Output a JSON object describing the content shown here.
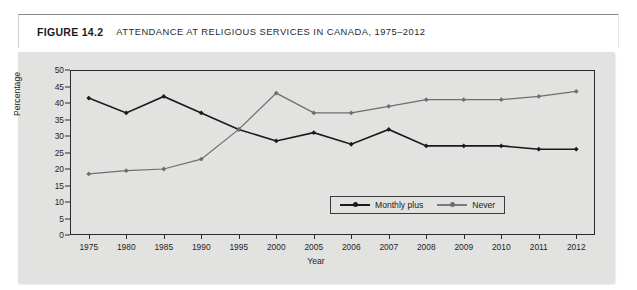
{
  "figure": {
    "number": "FIGURE 14.2",
    "title": "ATTENDANCE AT RELIGIOUS SERVICES IN CANADA, 1975–2012"
  },
  "colors": {
    "panel_background": "#e2e2e0",
    "frame": "#2a2a2a",
    "series_monthly_plus": "#1a1a1a",
    "series_never": "#6e6e6e",
    "title_text": "#1a1a1a"
  },
  "chart_data": {
    "type": "line",
    "title": "ATTENDANCE AT RELIGIOUS SERVICES IN CANADA, 1975–2012",
    "xlabel": "Year",
    "ylabel": "Percentage",
    "categories": [
      "1975",
      "1980",
      "1985",
      "1990",
      "1995",
      "2000",
      "2005",
      "2006",
      "2007",
      "2008",
      "2009",
      "2010",
      "2011",
      "2012"
    ],
    "ylim": [
      0,
      50
    ],
    "yticks": [
      0,
      5,
      10,
      15,
      20,
      25,
      30,
      35,
      40,
      45,
      50
    ],
    "grid": false,
    "legend_position": "bottom-center-inside",
    "series": [
      {
        "name": "Monthly plus",
        "color": "#1a1a1a",
        "marker": "diamond",
        "values": [
          41.5,
          37,
          42,
          37,
          32,
          28.5,
          31,
          27.5,
          32,
          27,
          27,
          27,
          26,
          26
        ]
      },
      {
        "name": "Never",
        "color": "#6e6e6e",
        "marker": "diamond",
        "values": [
          18.5,
          19.5,
          20,
          23,
          32,
          43,
          37,
          37,
          39,
          41,
          41,
          41,
          42,
          43.5
        ]
      }
    ]
  },
  "legend": {
    "entries": [
      {
        "label": "Monthly plus"
      },
      {
        "label": "Never"
      }
    ]
  }
}
